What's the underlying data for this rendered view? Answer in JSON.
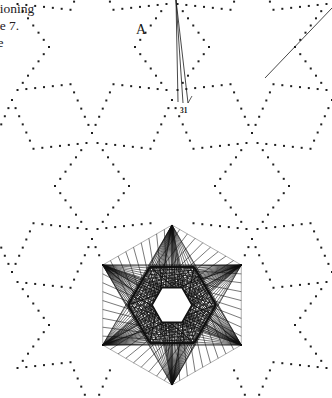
{
  "page": {
    "width": 332,
    "height": 398,
    "background_color": "#ffffff",
    "ink_color": "#1a1a1a",
    "text_color": "#24201e"
  },
  "body_text": {
    "note": "clipped running text at left margin of scanned page",
    "lines": [
      "sitioning",
      "age 7.",
      "the"
    ]
  },
  "labels": {
    "point_a": "A",
    "figure_number": "31"
  },
  "figure": {
    "dot_lattice": {
      "marker": "square-dot",
      "dot_size": 2,
      "color": "#1f1f1f",
      "motif": "hexagram outlines tiled across upper area",
      "cell_radius": 86,
      "centers": [
        {
          "cx": 12,
          "cy": 186
        },
        {
          "cx": 172,
          "cy": 186
        },
        {
          "cx": 332,
          "cy": 186
        },
        {
          "cx": 92,
          "cy": 47
        },
        {
          "cx": 252,
          "cy": 47
        },
        {
          "cx": 92,
          "cy": 325
        },
        {
          "cx": 252,
          "cy": 325
        }
      ]
    },
    "star_figure": {
      "type": "string-art hexagram",
      "center_x": 172,
      "center_y": 305,
      "outer_radius": 80,
      "inner_radius": 44,
      "hole_radius": 20,
      "chord_steps": 9,
      "stroke_width": 0.7,
      "color": "#111111"
    },
    "construction_lines": [
      {
        "x1": 176,
        "y1": 0,
        "x2": 188,
        "y2": 103
      },
      {
        "x1": 176,
        "y1": 0,
        "x2": 178,
        "y2": 102
      },
      {
        "x1": 176,
        "y1": 0,
        "x2": 183,
        "y2": 103
      },
      {
        "x1": 332,
        "y1": 8,
        "x2": 265,
        "y2": 78
      }
    ],
    "leader_line": {
      "x1": 188,
      "y1": 103,
      "x2": 192,
      "y2": 96
    }
  }
}
